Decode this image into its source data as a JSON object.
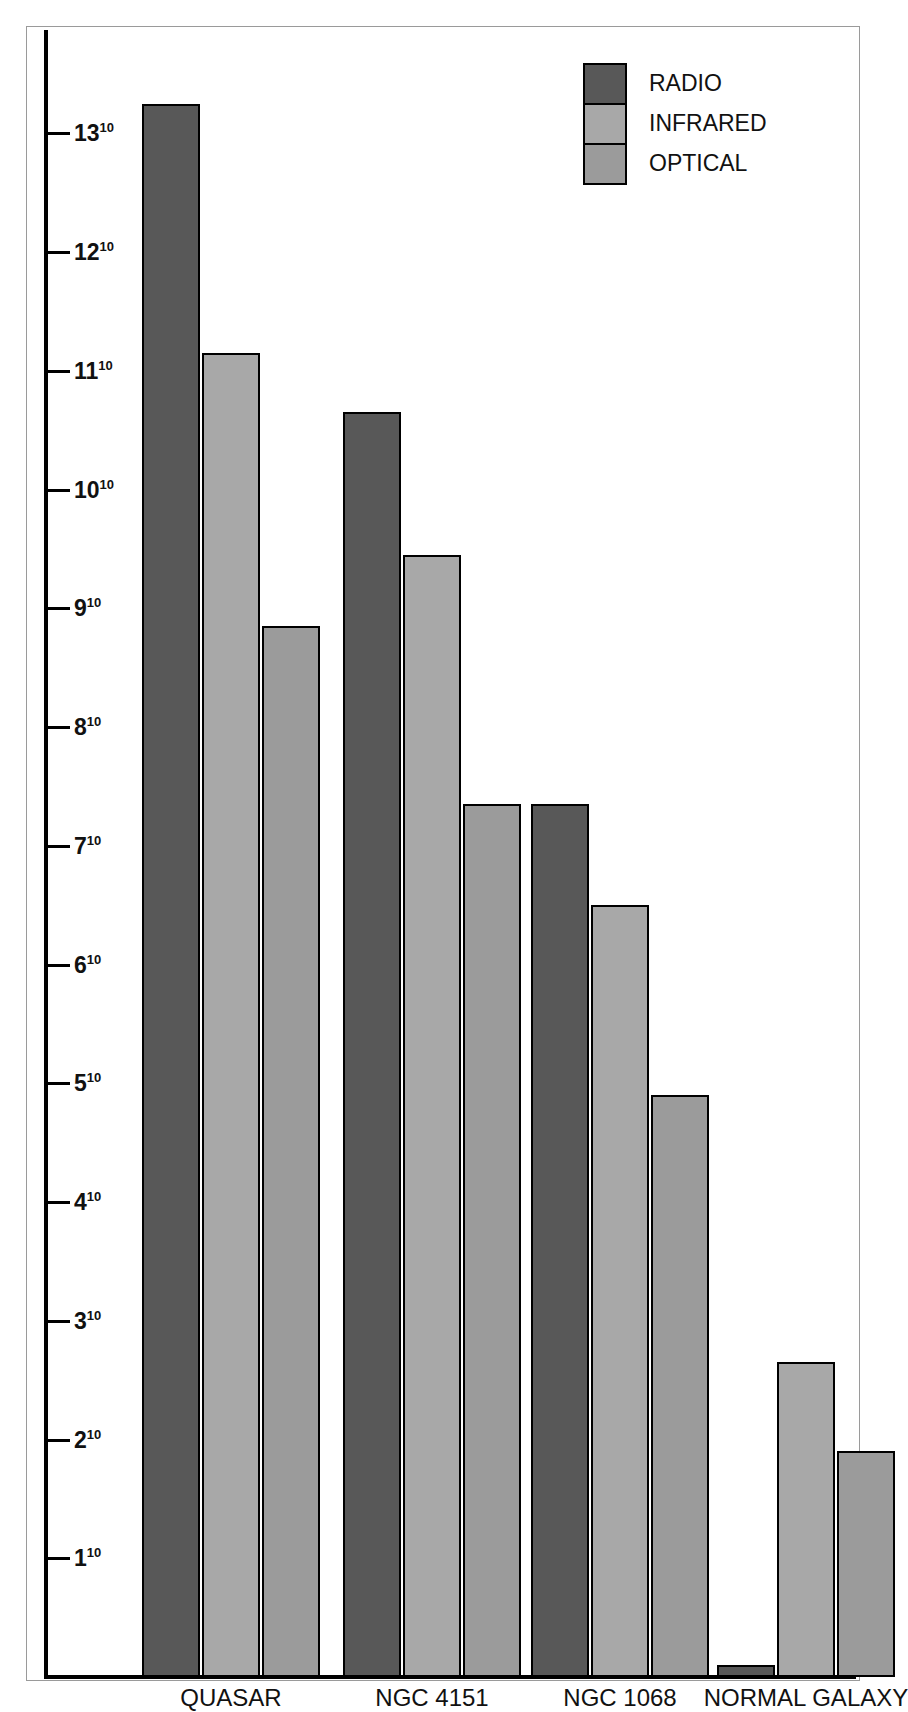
{
  "chart_data": {
    "type": "bar",
    "title": "",
    "subtitle": "",
    "xlabel": "",
    "ylabel": "",
    "categories": [
      "QUASAR",
      "NGC 4151",
      "NGC 1068",
      "NORMAL GALAXY"
    ],
    "series": [
      {
        "name": "RADIO",
        "color": "#585858",
        "values": [
          13.25,
          10.65,
          7.35,
          0.1
        ]
      },
      {
        "name": "INFRARED",
        "color": "#a8a8a8",
        "values": [
          11.15,
          9.45,
          6.5,
          2.65
        ]
      },
      {
        "name": "OPTICAL",
        "color": "#9b9b9b",
        "values": [
          8.85,
          7.35,
          4.9,
          1.9
        ]
      }
    ],
    "ylim": [
      0,
      13.9
    ],
    "y_tick_values": [
      1,
      2,
      3,
      4,
      5,
      6,
      7,
      8,
      9,
      10,
      11,
      12,
      13
    ],
    "y_tick_labels": [
      "1",
      "2",
      "3",
      "4",
      "5",
      "6",
      "7",
      "8",
      "9",
      "10",
      "11",
      "12",
      "13"
    ],
    "y_tick_exponent": "10",
    "grid": false,
    "legend_position": "top-right"
  },
  "axis": {
    "tick_exponent": "10",
    "ticks": [
      {
        "label": "13",
        "value": 13
      },
      {
        "label": "12",
        "value": 12
      },
      {
        "label": "11",
        "value": 11
      },
      {
        "label": "10",
        "value": 10
      },
      {
        "label": "9",
        "value": 9
      },
      {
        "label": "8",
        "value": 8
      },
      {
        "label": "7",
        "value": 7
      },
      {
        "label": "6",
        "value": 6
      },
      {
        "label": "5",
        "value": 5
      },
      {
        "label": "4",
        "value": 4
      },
      {
        "label": "3",
        "value": 3
      },
      {
        "label": "2",
        "value": 2
      },
      {
        "label": "1",
        "value": 1
      }
    ]
  },
  "legend": {
    "items": [
      {
        "label": "RADIO",
        "color": "#585858",
        "key": "radio"
      },
      {
        "label": "INFRARED",
        "color": "#a8a8a8",
        "key": "infrared"
      },
      {
        "label": "OPTICAL",
        "color": "#9b9b9b",
        "key": "optical"
      }
    ]
  },
  "categories": [
    {
      "label": "QUASAR"
    },
    {
      "label": "NGC 4151"
    },
    {
      "label": "NGC 1068"
    },
    {
      "label": "NORMAL GALAXY"
    }
  ],
  "colors": {
    "radio": "#585858",
    "infrared": "#a8a8a8",
    "optical": "#9b9b9b",
    "axis": "#000000",
    "frame": "#9a9a9a",
    "background": "#ffffff",
    "text": "#111111"
  }
}
